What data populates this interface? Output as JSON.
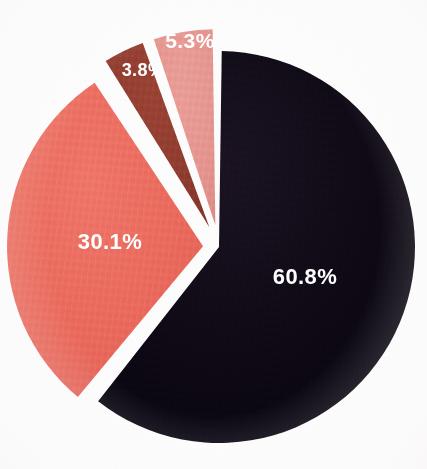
{
  "chart_data": {
    "type": "pie",
    "title": "",
    "subtitle": "",
    "xlabel": "",
    "ylabel": "",
    "grid": false,
    "legend_position": "none",
    "background_color": "#fdfcfc",
    "label_color": "#ffffff",
    "categories": [
      "Segment 1",
      "Segment 2",
      "Segment 3",
      "Segment 4"
    ],
    "values": [
      60.8,
      30.1,
      3.8,
      5.3
    ],
    "labels": [
      "60.8%",
      "30.1%",
      "3.8%",
      "5.3%"
    ],
    "colors": [
      "#0d0813",
      "#e9675a",
      "#8c3a2e",
      "#e4928c"
    ],
    "slices": [
      {
        "label": "60.8%",
        "value": 60.8,
        "color": "#0d0813",
        "start_angle": 0,
        "end_angle": 218.88,
        "exploded": false,
        "explode_offset": 0,
        "label_x": 305,
        "label_y": 278,
        "label_size": 22
      },
      {
        "label": "30.1%",
        "value": 30.1,
        "color": "#e9675a",
        "start_angle": 218.88,
        "end_angle": 327.24,
        "exploded": true,
        "explode_offset": 16,
        "label_x": 110,
        "label_y": 243,
        "label_size": 22
      },
      {
        "label": "3.8%",
        "value": 3.8,
        "color": "#8c3a2e",
        "start_angle": 327.24,
        "end_angle": 340.92,
        "exploded": true,
        "explode_offset": 22,
        "label_x": 143,
        "label_y": 71,
        "label_size": 18
      },
      {
        "label": "5.3%",
        "value": 5.3,
        "color": "#e4928c",
        "start_angle": 340.92,
        "end_angle": 360,
        "exploded": true,
        "explode_offset": 22,
        "label_x": 190,
        "label_y": 42,
        "label_size": 21
      }
    ],
    "geometry": {
      "center_x": 219,
      "center_y": 247,
      "radius": 196,
      "gap_degrees": 1.6
    }
  }
}
